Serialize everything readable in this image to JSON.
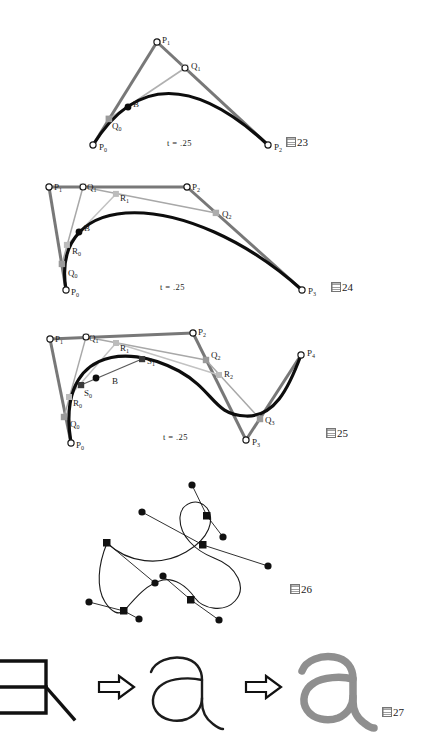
{
  "page": {
    "background": "#ffffff",
    "width": 423,
    "height": 752
  },
  "palette": {
    "curve": "#0d0d0d",
    "polygon_dark": "#6b6b6b",
    "polygon_mid": "#8e8e8e",
    "polygon_light": "#b9b9b9",
    "point_fill": "#ffffff",
    "point_stroke": "#1a1a1a",
    "gray_glyph": "#8f8f8f",
    "outline": "#111111"
  },
  "figures": [
    {
      "id": "fig23",
      "caption_prefix": "圖",
      "caption_number": "23",
      "t_label": "t = .25",
      "description": "de Casteljau construction on a quadratic Bezier curve",
      "points": [
        {
          "name": "P0",
          "label": "P",
          "sub": "0",
          "x": 93,
          "y": 145,
          "kind": "control"
        },
        {
          "name": "P1",
          "label": "P",
          "sub": "1",
          "x": 157,
          "y": 42,
          "kind": "control"
        },
        {
          "name": "P2",
          "label": "P",
          "sub": "2",
          "x": 268,
          "y": 145,
          "kind": "control"
        },
        {
          "name": "Q0",
          "label": "Q",
          "sub": "0",
          "x": 109,
          "y": 119,
          "kind": "intermediate"
        },
        {
          "name": "Q1",
          "label": "Q",
          "sub": "1",
          "x": 185,
          "y": 68,
          "kind": "intermediate"
        },
        {
          "name": "B",
          "label": "B",
          "sub": "",
          "x": 128,
          "y": 107,
          "kind": "on-curve"
        }
      ]
    },
    {
      "id": "fig24",
      "caption_prefix": "圖",
      "caption_number": "24",
      "t_label": "t = .25",
      "description": "de Casteljau construction on a cubic Bezier curve",
      "points": [
        {
          "name": "P0",
          "label": "P",
          "sub": "0",
          "x": 66,
          "y": 290,
          "kind": "control"
        },
        {
          "name": "P1",
          "label": "P",
          "sub": "1",
          "x": 49,
          "y": 187,
          "kind": "control"
        },
        {
          "name": "P2",
          "label": "P",
          "sub": "2",
          "x": 187,
          "y": 187,
          "kind": "control"
        },
        {
          "name": "P3",
          "label": "P",
          "sub": "3",
          "x": 302,
          "y": 290,
          "kind": "control"
        },
        {
          "name": "Q0",
          "label": "Q",
          "sub": "0",
          "x": 62,
          "y": 264,
          "kind": "intermediate"
        },
        {
          "name": "Q1",
          "label": "Q",
          "sub": "1",
          "x": 83,
          "y": 187,
          "kind": "intermediate"
        },
        {
          "name": "Q2",
          "label": "Q",
          "sub": "2",
          "x": 216,
          "y": 213,
          "kind": "intermediate"
        },
        {
          "name": "R0",
          "label": "R",
          "sub": "0",
          "x": 67,
          "y": 245,
          "kind": "intermediate2"
        },
        {
          "name": "R1",
          "label": "R",
          "sub": "1",
          "x": 116,
          "y": 194,
          "kind": "intermediate2"
        },
        {
          "name": "B",
          "label": "B",
          "sub": "",
          "x": 79,
          "y": 232,
          "kind": "on-curve"
        }
      ]
    },
    {
      "id": "fig25",
      "caption_prefix": "圖",
      "caption_number": "25",
      "t_label": "t = .25",
      "description": "de Casteljau construction on a quartic Bezier curve",
      "points": [
        {
          "name": "P0",
          "label": "P",
          "sub": "0",
          "x": 71,
          "y": 443,
          "kind": "control"
        },
        {
          "name": "P1",
          "label": "P",
          "sub": "1",
          "x": 50,
          "y": 339,
          "kind": "control"
        },
        {
          "name": "P2",
          "label": "P",
          "sub": "2",
          "x": 193,
          "y": 333,
          "kind": "control"
        },
        {
          "name": "P3",
          "label": "P",
          "sub": "3",
          "x": 246,
          "y": 440,
          "kind": "control"
        },
        {
          "name": "P4",
          "label": "P",
          "sub": "4",
          "x": 301,
          "y": 355,
          "kind": "control"
        },
        {
          "name": "Q0",
          "label": "Q",
          "sub": "0",
          "x": 64,
          "y": 417,
          "kind": "intermediate"
        },
        {
          "name": "Q1",
          "label": "Q",
          "sub": "1",
          "x": 86,
          "y": 337,
          "kind": "intermediate"
        },
        {
          "name": "Q2",
          "label": "Q",
          "sub": "2",
          "x": 206,
          "y": 360,
          "kind": "intermediate"
        },
        {
          "name": "Q3",
          "label": "Q",
          "sub": "3",
          "x": 260,
          "y": 419,
          "kind": "intermediate"
        },
        {
          "name": "R0",
          "label": "R",
          "sub": "0",
          "x": 69,
          "y": 397,
          "kind": "intermediate2"
        },
        {
          "name": "R1",
          "label": "R",
          "sub": "1",
          "x": 116,
          "y": 343,
          "kind": "intermediate2"
        },
        {
          "name": "R2",
          "label": "R",
          "sub": "2",
          "x": 219,
          "y": 375,
          "kind": "intermediate2"
        },
        {
          "name": "S0",
          "label": "S",
          "sub": "0",
          "x": 81,
          "y": 385,
          "kind": "intermediate3"
        },
        {
          "name": "S1",
          "label": "S",
          "sub": "1",
          "x": 142,
          "y": 359,
          "kind": "intermediate3"
        },
        {
          "name": "B",
          "label": "B",
          "sub": "",
          "x": 96,
          "y": 378,
          "kind": "on-curve"
        }
      ]
    },
    {
      "id": "fig26",
      "caption_prefix": "圖",
      "caption_number": "26",
      "t_label": "",
      "description": "Composite spline curve with square knot points and round tangent handles",
      "knots": [
        {
          "name": "knot-left",
          "x": 107,
          "y": 543
        },
        {
          "name": "knot-upper-right",
          "x": 207,
          "y": 516
        },
        {
          "name": "knot-center",
          "x": 203,
          "y": 545
        },
        {
          "name": "knot-lower-left",
          "x": 124,
          "y": 611
        },
        {
          "name": "knot-lower-right",
          "x": 191,
          "y": 600
        }
      ],
      "handles": [
        {
          "name": "handle-top",
          "x": 192,
          "y": 485
        },
        {
          "name": "handle-upper-left",
          "x": 142,
          "y": 512
        },
        {
          "name": "handle-right-mid",
          "x": 223,
          "y": 537
        },
        {
          "name": "handle-right-low",
          "x": 268,
          "y": 566
        },
        {
          "name": "handle-left-low",
          "x": 155,
          "y": 583
        },
        {
          "name": "handle-mid-low",
          "x": 163,
          "y": 576
        },
        {
          "name": "handle-far-left",
          "x": 89,
          "y": 602
        },
        {
          "name": "handle-bottom-left",
          "x": 139,
          "y": 619
        },
        {
          "name": "handle-bottom",
          "x": 219,
          "y": 620
        }
      ]
    },
    {
      "id": "fig27",
      "caption_prefix": "圖",
      "caption_number": "27",
      "t_label": "",
      "description": "Font rasterization pipeline: outline grid to glyph outline to filled gray glyph",
      "stages": [
        {
          "name": "stage-grid-outline",
          "kind": "grid"
        },
        {
          "name": "stage-arrow-1",
          "kind": "arrow",
          "glyph": "⇨"
        },
        {
          "name": "stage-outline-a",
          "kind": "outline-glyph",
          "glyph": "a"
        },
        {
          "name": "stage-arrow-2",
          "kind": "arrow",
          "glyph": "⇨"
        },
        {
          "name": "stage-filled-a",
          "kind": "filled-glyph",
          "glyph": "a"
        }
      ]
    }
  ]
}
